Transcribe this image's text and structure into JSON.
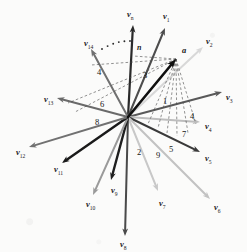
{
  "figure": {
    "background": "#fbfbfa",
    "origin": {
      "x": 128,
      "y": 117
    },
    "point_a": {
      "x": 176,
      "y": 59,
      "label": "a"
    },
    "angle_label": {
      "text": "n",
      "x": 137,
      "y": 44
    }
  },
  "chart_data": {
    "type": "scatter",
    "xlabel": "",
    "ylabel": "",
    "origin": [
      128,
      117
    ],
    "target_point": {
      "name": "a",
      "x": 176,
      "y": 59
    },
    "vectors": [
      {
        "label": "v",
        "sub": "n",
        "tip_x": 133,
        "tip_y": 25,
        "color": "#2a2a2a",
        "width": 2.2,
        "label_x": 127,
        "label_y": 10
      },
      {
        "label": "v",
        "sub": "1",
        "tip_x": 165,
        "tip_y": 28,
        "color": "#4d4d4d",
        "width": 2.0,
        "label_x": 163,
        "label_y": 12
      },
      {
        "label": "v",
        "sub": "2",
        "tip_x": 203,
        "tip_y": 47,
        "color": "#d8d8d8",
        "width": 2.0,
        "label_x": 206,
        "label_y": 37
      },
      {
        "label": "v",
        "sub": "3",
        "tip_x": 222,
        "tip_y": 92,
        "color": "#595959",
        "width": 2.0,
        "label_x": 226,
        "label_y": 93
      },
      {
        "label": "v",
        "sub": "4",
        "tip_x": 200,
        "tip_y": 122,
        "color": "#bdbdbd",
        "width": 2.0,
        "label_x": 205,
        "label_y": 122
      },
      {
        "label": "v",
        "sub": "5",
        "tip_x": 200,
        "tip_y": 152,
        "color": "#3a3a3a",
        "width": 2.2,
        "label_x": 205,
        "label_y": 154
      },
      {
        "label": "v",
        "sub": "6",
        "tip_x": 210,
        "tip_y": 199,
        "color": "#c2c2c2",
        "width": 2.0,
        "label_x": 214,
        "label_y": 203
      },
      {
        "label": "v",
        "sub": "7",
        "tip_x": 158,
        "tip_y": 191,
        "color": "#c8c8c8",
        "width": 2.0,
        "label_x": 159,
        "label_y": 199
      },
      {
        "label": "v",
        "sub": "8",
        "tip_x": 125,
        "tip_y": 236,
        "color": "#4a4a4a",
        "width": 2.0,
        "label_x": 120,
        "label_y": 240
      },
      {
        "label": "v",
        "sub": "9",
        "tip_x": 111,
        "tip_y": 180,
        "color": "#1f1f1f",
        "width": 2.4,
        "label_x": 111,
        "label_y": 186
      },
      {
        "label": "v",
        "sub": "10",
        "tip_x": 93,
        "tip_y": 195,
        "color": "#9a9a9a",
        "width": 2.0,
        "label_x": 86,
        "label_y": 200
      },
      {
        "label": "v",
        "sub": "11",
        "tip_x": 62,
        "tip_y": 163,
        "color": "#1a1a1a",
        "width": 2.4,
        "label_x": 54,
        "label_y": 165
      },
      {
        "label": "v",
        "sub": "12",
        "tip_x": 29,
        "tip_y": 147,
        "color": "#717171",
        "width": 2.0,
        "label_x": 16,
        "label_y": 148
      },
      {
        "label": "v",
        "sub": "13",
        "tip_x": 57,
        "tip_y": 98,
        "color": "#6a6a6a",
        "width": 2.0,
        "label_x": 44,
        "label_y": 95
      },
      {
        "label": "v",
        "sub": "14",
        "tip_x": 91,
        "tip_y": 49,
        "color": "#707070",
        "width": 2.0,
        "label_x": 84,
        "label_y": 39
      }
    ],
    "sector_numbers": [
      {
        "text": "1",
        "x": 163,
        "y": 97
      },
      {
        "text": "2",
        "x": 137,
        "y": 148
      },
      {
        "text": "3",
        "x": 143,
        "y": 71
      },
      {
        "text": "4",
        "x": 97,
        "y": 68
      },
      {
        "text": "4",
        "x": 190,
        "y": 112
      },
      {
        "text": "5",
        "x": 169,
        "y": 145
      },
      {
        "text": "6",
        "x": 100,
        "y": 100
      },
      {
        "text": "7",
        "x": 182,
        "y": 130
      },
      {
        "text": "8",
        "x": 95,
        "y": 118
      },
      {
        "text": "9",
        "x": 156,
        "y": 151
      }
    ],
    "dashed_fan_from_a": [
      {
        "x": 128,
        "y": 117
      },
      {
        "x": 148,
        "y": 124
      },
      {
        "x": 158,
        "y": 128
      },
      {
        "x": 167,
        "y": 133
      },
      {
        "x": 177,
        "y": 136
      },
      {
        "x": 188,
        "y": 133
      },
      {
        "x": 196,
        "y": 124
      },
      {
        "x": 91,
        "y": 65
      },
      {
        "x": 68,
        "y": 103
      },
      {
        "x": 75,
        "y": 112
      },
      {
        "x": 133,
        "y": 56
      }
    ],
    "dotted_arc": {
      "from": [
        102,
        49
      ],
      "to": [
        130,
        41
      ]
    },
    "legend": [],
    "grid": false
  }
}
